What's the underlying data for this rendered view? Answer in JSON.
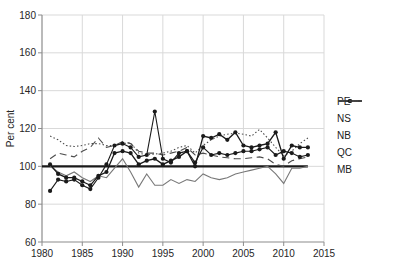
{
  "figure": {
    "background": "#ffffff",
    "axis_color": "#8c8c8c",
    "grid_color": "#d9d9d9",
    "tick_label_color": "#262626",
    "series_color": "#1a1a1a",
    "ns_color": "#787878"
  },
  "chart_data": {
    "type": "line",
    "title": "",
    "xlabel": "",
    "ylabel": "Per cent",
    "xlim": [
      1980,
      2015
    ],
    "ylim": [
      60,
      180
    ],
    "x_ticks": [
      1980,
      1985,
      1990,
      1995,
      2000,
      2005,
      2010,
      2015
    ],
    "y_ticks": [
      60,
      80,
      100,
      120,
      140,
      160,
      180
    ],
    "grid": true,
    "legend_position": "right-outside",
    "reference_line": {
      "y": 100,
      "x_start": 1980,
      "x_end": 2013,
      "color": "#1a1a1a",
      "width": 2.2
    },
    "x": [
      1981,
      1982,
      1983,
      1984,
      1985,
      1986,
      1987,
      1988,
      1989,
      1990,
      1991,
      1992,
      1993,
      1994,
      1995,
      1996,
      1997,
      1998,
      1999,
      2000,
      2001,
      2002,
      2003,
      2004,
      2005,
      2006,
      2007,
      2008,
      2009,
      2010,
      2011,
      2012,
      2013
    ],
    "series": [
      {
        "name": "PE",
        "style": "solid-marker",
        "color": "#1a1a1a",
        "values": [
          101,
          96,
          94,
          94,
          92,
          90,
          95,
          97,
          107,
          108,
          107,
          101,
          103,
          104,
          101,
          103,
          105,
          108,
          100,
          116,
          115,
          117,
          114,
          118,
          111,
          110,
          111,
          112,
          118,
          104,
          111,
          110,
          110
        ]
      },
      {
        "name": "NS",
        "style": "solid",
        "color": "#787878",
        "values": [
          100,
          97,
          95,
          97,
          94,
          92,
          95,
          94,
          99,
          104,
          97,
          89,
          96,
          90,
          90,
          93,
          91,
          93,
          92,
          96,
          94,
          93,
          94,
          96,
          97,
          98,
          99,
          100,
          96,
          91,
          99,
          99,
          100
        ]
      },
      {
        "name": "NB",
        "style": "solid-marker",
        "color": "#1a1a1a",
        "values": [
          87,
          93,
          92,
          93,
          90,
          88,
          94,
          101,
          111,
          112,
          110,
          105,
          106,
          129,
          104,
          102,
          107,
          108,
          102,
          110,
          106,
          107,
          106,
          107,
          108,
          108,
          109,
          110,
          106,
          108,
          107,
          105,
          106
        ]
      },
      {
        "name": "QC",
        "style": "dotted",
        "color": "#4d4d4d",
        "values": [
          116,
          114,
          111,
          110.5,
          111,
          112,
          112,
          111,
          111,
          112,
          112.5,
          107,
          106,
          106.5,
          107,
          108,
          110,
          111,
          107,
          111,
          114,
          116,
          117,
          117.5,
          117,
          116,
          119.5,
          115,
          110,
          105.5,
          108,
          112,
          115
        ]
      },
      {
        "name": "MB",
        "style": "dashed",
        "color": "#4d4d4d",
        "values": [
          104,
          107,
          106,
          105,
          108,
          110,
          115,
          110,
          111,
          113,
          112,
          108,
          107,
          107,
          106,
          107,
          108,
          110,
          106,
          107,
          106,
          105,
          104.5,
          104,
          104,
          104.5,
          105,
          104,
          101,
          100,
          103,
          104,
          105
        ]
      }
    ]
  }
}
